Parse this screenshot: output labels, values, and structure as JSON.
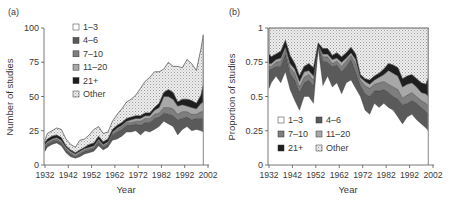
{
  "colors": {
    "c1_3": "#ffffff",
    "c4_6": "#5a5a5a",
    "c7_10": "#7e7e7e",
    "c11_20": "#a8a8a8",
    "c21p": "#1e1e1e",
    "other": "#e2e2e2",
    "axis": "#555555",
    "text": "#3a3a3a"
  },
  "chart_data": [
    {
      "panel_label": "(a)",
      "type": "area",
      "stacked": true,
      "title": "",
      "xlabel": "Year",
      "ylabel": "Number of studies",
      "xlim": [
        1932,
        2002
      ],
      "ylim": [
        0,
        100
      ],
      "xticks": [
        1932,
        1942,
        1952,
        1962,
        1972,
        1982,
        1992,
        2002
      ],
      "xtick_labels": [
        "1932",
        "1942",
        "1952",
        "1962",
        "1972",
        "1982",
        "1992",
        "2002"
      ],
      "yticks": [
        0,
        25,
        50,
        75,
        100
      ],
      "ytick_labels": [
        "0",
        "25",
        "50",
        "75",
        "100"
      ],
      "grid": false,
      "legend": {
        "position": "upper-left",
        "columns": 1,
        "entries": [
          "1–3",
          "4–6",
          "7–10",
          "11–20",
          "21+",
          "Other"
        ]
      },
      "x": [
        1932,
        1933,
        1935,
        1937,
        1939,
        1941,
        1943,
        1945,
        1947,
        1949,
        1951,
        1953,
        1955,
        1957,
        1959,
        1961,
        1963,
        1965,
        1967,
        1969,
        1971,
        1973,
        1975,
        1977,
        1979,
        1981,
        1983,
        1985,
        1987,
        1989,
        1991,
        1993,
        1995,
        1997,
        1999,
        2000
      ],
      "series": [
        {
          "name": "1–3",
          "values": [
            10,
            13,
            15,
            16,
            14,
            9,
            6,
            5,
            6,
            8,
            9,
            10,
            14,
            11,
            13,
            18,
            19,
            21,
            24,
            24,
            25,
            22,
            25,
            24,
            26,
            28,
            32,
            30,
            28,
            22,
            26,
            28,
            25,
            26,
            25,
            24
          ]
        },
        {
          "name": "4–6",
          "values": [
            3,
            2,
            2,
            2,
            2,
            2,
            2,
            1,
            2,
            2,
            2,
            2,
            3,
            2,
            2,
            4,
            5,
            5,
            5,
            5,
            5,
            7,
            6,
            7,
            8,
            7,
            6,
            7,
            8,
            11,
            8,
            7,
            8,
            8,
            9,
            10
          ]
        },
        {
          "name": "7–10",
          "values": [
            1,
            1,
            1,
            1,
            1,
            1,
            1,
            1,
            1,
            1,
            1,
            1,
            1,
            1,
            1,
            1,
            2,
            2,
            2,
            2,
            2,
            3,
            3,
            3,
            3,
            3,
            4,
            5,
            5,
            4,
            5,
            4,
            4,
            3,
            5,
            5
          ]
        },
        {
          "name": "11–20",
          "values": [
            1,
            1,
            1,
            1,
            1,
            1,
            1,
            1,
            1,
            1,
            1,
            1,
            1,
            1,
            1,
            1,
            1,
            1,
            1,
            2,
            2,
            2,
            2,
            2,
            3,
            4,
            8,
            8,
            7,
            6,
            5,
            4,
            5,
            4,
            6,
            7
          ]
        },
        {
          "name": "21+",
          "values": [
            1,
            2,
            2,
            2,
            2,
            1,
            1,
            1,
            1,
            1,
            2,
            2,
            2,
            2,
            2,
            2,
            2,
            2,
            2,
            2,
            2,
            2,
            2,
            2,
            2,
            3,
            3,
            5,
            5,
            3,
            4,
            5,
            5,
            4,
            6,
            13
          ]
        },
        {
          "name": "Other",
          "values": [
            2,
            4,
            4,
            5,
            6,
            5,
            4,
            4,
            7,
            6,
            7,
            10,
            7,
            6,
            5,
            6,
            8,
            10,
            12,
            13,
            15,
            20,
            23,
            26,
            26,
            23,
            17,
            20,
            19,
            26,
            23,
            29,
            27,
            24,
            34,
            36
          ]
        }
      ],
      "totals": [
        18,
        23,
        25,
        27,
        26,
        19,
        15,
        13,
        18,
        19,
        22,
        26,
        28,
        23,
        24,
        32,
        37,
        41,
        46,
        48,
        51,
        56,
        61,
        64,
        68,
        68,
        70,
        75,
        72,
        72,
        71,
        77,
        74,
        69,
        85,
        95
      ]
    },
    {
      "panel_label": "(b)",
      "type": "area",
      "stacked": true,
      "title": "",
      "xlabel": "Year",
      "ylabel": "Proportion of studies",
      "xlim": [
        1932,
        2002
      ],
      "ylim": [
        0,
        1
      ],
      "xticks": [
        1932,
        1942,
        1952,
        1962,
        1972,
        1982,
        1992,
        2002
      ],
      "xtick_labels": [
        "1932",
        "1942",
        "1952",
        "1962",
        "1972",
        "1982",
        "1992",
        "2002"
      ],
      "yticks": [
        0,
        0.25,
        0.5,
        0.75,
        1
      ],
      "ytick_labels": [
        "0",
        "0.25",
        "0.5",
        "0.75",
        "1"
      ],
      "grid": false,
      "legend": {
        "position": "lower-left",
        "columns": 2,
        "entries": [
          "1–3",
          "4–6",
          "7–10",
          "11–20",
          "21+",
          "Other"
        ]
      },
      "x": [
        1932,
        1933,
        1935,
        1937,
        1939,
        1941,
        1943,
        1945,
        1947,
        1949,
        1951,
        1953,
        1955,
        1957,
        1959,
        1961,
        1963,
        1965,
        1967,
        1969,
        1971,
        1973,
        1975,
        1977,
        1979,
        1981,
        1983,
        1985,
        1987,
        1989,
        1991,
        1993,
        1995,
        1997,
        1999,
        2000
      ],
      "series": [
        {
          "name": "1–3",
          "values": [
            0.56,
            0.6,
            0.65,
            0.6,
            0.68,
            0.55,
            0.47,
            0.4,
            0.5,
            0.5,
            0.45,
            0.85,
            0.58,
            0.65,
            0.57,
            0.6,
            0.52,
            0.6,
            0.62,
            0.56,
            0.5,
            0.4,
            0.37,
            0.45,
            0.42,
            0.45,
            0.42,
            0.4,
            0.35,
            0.3,
            0.35,
            0.37,
            0.33,
            0.3,
            0.27,
            0.25
          ]
        },
        {
          "name": "4–6",
          "values": [
            0.13,
            0.1,
            0.07,
            0.12,
            0.13,
            0.12,
            0.15,
            0.13,
            0.1,
            0.12,
            0.13,
            0.02,
            0.18,
            0.1,
            0.15,
            0.13,
            0.16,
            0.12,
            0.15,
            0.12,
            0.08,
            0.12,
            0.13,
            0.09,
            0.12,
            0.1,
            0.11,
            0.1,
            0.13,
            0.14,
            0.1,
            0.1,
            0.12,
            0.12,
            0.12,
            0.12
          ]
        },
        {
          "name": "7–10",
          "values": [
            0.03,
            0.02,
            0.03,
            0.04,
            0.03,
            0.04,
            0.05,
            0.04,
            0.04,
            0.04,
            0.04,
            0.01,
            0.03,
            0.04,
            0.02,
            0.03,
            0.04,
            0.04,
            0.03,
            0.06,
            0.04,
            0.06,
            0.06,
            0.05,
            0.06,
            0.06,
            0.06,
            0.07,
            0.07,
            0.05,
            0.06,
            0.06,
            0.05,
            0.05,
            0.06,
            0.06
          ]
        },
        {
          "name": "11–20",
          "values": [
            0.02,
            0.02,
            0.02,
            0.02,
            0.02,
            0.03,
            0.03,
            0.04,
            0.04,
            0.03,
            0.03,
            0.0,
            0.02,
            0.02,
            0.03,
            0.02,
            0.03,
            0.02,
            0.02,
            0.03,
            0.02,
            0.03,
            0.03,
            0.03,
            0.04,
            0.05,
            0.1,
            0.1,
            0.1,
            0.08,
            0.08,
            0.07,
            0.07,
            0.06,
            0.07,
            0.07
          ]
        },
        {
          "name": "21+",
          "values": [
            0.07,
            0.05,
            0.04,
            0.05,
            0.05,
            0.06,
            0.04,
            0.04,
            0.04,
            0.05,
            0.06,
            0.01,
            0.04,
            0.04,
            0.03,
            0.04,
            0.04,
            0.04,
            0.04,
            0.04,
            0.02,
            0.02,
            0.03,
            0.03,
            0.03,
            0.04,
            0.05,
            0.06,
            0.06,
            0.06,
            0.06,
            0.06,
            0.06,
            0.07,
            0.07,
            0.14
          ]
        },
        {
          "name": "Other",
          "values": [
            0.19,
            0.21,
            0.19,
            0.17,
            0.09,
            0.2,
            0.26,
            0.35,
            0.28,
            0.26,
            0.29,
            0.11,
            0.15,
            0.15,
            0.2,
            0.18,
            0.21,
            0.18,
            0.14,
            0.19,
            0.34,
            0.37,
            0.38,
            0.35,
            0.33,
            0.3,
            0.26,
            0.27,
            0.29,
            0.37,
            0.35,
            0.34,
            0.37,
            0.4,
            0.41,
            0.36
          ]
        }
      ]
    }
  ],
  "panels": [
    {
      "label": "(a)",
      "ylabel": "Number of studies",
      "xlabel": "Year"
    },
    {
      "label": "(b)",
      "ylabel": "Proportion of studies",
      "xlabel": "Year"
    }
  ]
}
